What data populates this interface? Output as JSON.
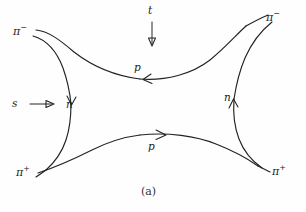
{
  "figure": {
    "caption": "(a)",
    "background_color": "#fefefe",
    "ink_color": "#222222",
    "width": 306,
    "height": 212
  },
  "external_legs": [
    {
      "id": "pi-minus-top-left",
      "base": "π",
      "charge": "−",
      "position": "top-left"
    },
    {
      "id": "pi-minus-top-right",
      "base": "π",
      "charge": "−",
      "position": "top-right"
    },
    {
      "id": "pi-plus-bottom-left",
      "base": "π",
      "charge": "+",
      "position": "bottom-left"
    },
    {
      "id": "pi-plus-bottom-right",
      "base": "π",
      "charge": "+",
      "position": "bottom-right"
    }
  ],
  "internal_lines": [
    {
      "id": "p-top",
      "label": "p",
      "arrow_direction": "left",
      "position": "top-middle"
    },
    {
      "id": "p-bottom",
      "label": "p",
      "arrow_direction": "right",
      "position": "bottom-middle"
    },
    {
      "id": "n-left",
      "label": "n",
      "arrow_direction": "down",
      "position": "left-middle"
    },
    {
      "id": "n-right",
      "label": "n",
      "arrow_direction": "up",
      "position": "right-middle"
    }
  ],
  "channels": [
    {
      "id": "s-channel",
      "label": "s",
      "arrow_direction": "right",
      "position": "left"
    },
    {
      "id": "t-channel",
      "label": "t",
      "arrow_direction": "down",
      "position": "top"
    }
  ]
}
